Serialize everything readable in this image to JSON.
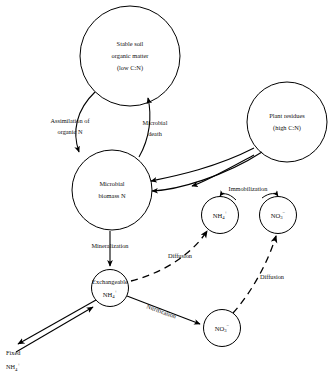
{
  "diagram": {
    "stroke_color": "#000000",
    "background_color": "#ffffff",
    "nodes": {
      "stable_organic_matter": {
        "line1": "Stable soil",
        "line2": "organic matter",
        "line3": "(low C:N)"
      },
      "plant_residues": {
        "line1": "Plant residues",
        "line2": "(high C:N)"
      },
      "microbial_biomass": {
        "line1": "Microbial",
        "line2": "biomass N"
      },
      "solution_ammonium": {
        "formula": "NH",
        "sub": "4",
        "sup": "+"
      },
      "solution_nitrate": {
        "formula": "NO",
        "sub": "3",
        "sup": "−"
      },
      "exchangeable_ammonium": {
        "caption": "Exchangeable",
        "formula": "NH",
        "sub": "4",
        "sup": "+"
      },
      "soil_nitrate": {
        "formula": "NO",
        "sub": "3",
        "sup": "−"
      },
      "fixed_ammonium": {
        "line1": "Fixed",
        "formula": "NH",
        "sub": "4",
        "sup": "+"
      }
    },
    "edges": {
      "assimilation": {
        "line1": "Assimilation of",
        "line2": "organic N"
      },
      "microbial_death": {
        "line1": "Microbial",
        "line2": "death"
      },
      "immobilization": {
        "label": "Immobilization"
      },
      "mineralization": {
        "label": "Mineralization"
      },
      "nitrification": {
        "label": "Nitrification"
      },
      "diffusion_ammonium": {
        "label": "Diffusion"
      },
      "diffusion_nitrate": {
        "label": "Diffusion"
      }
    }
  }
}
